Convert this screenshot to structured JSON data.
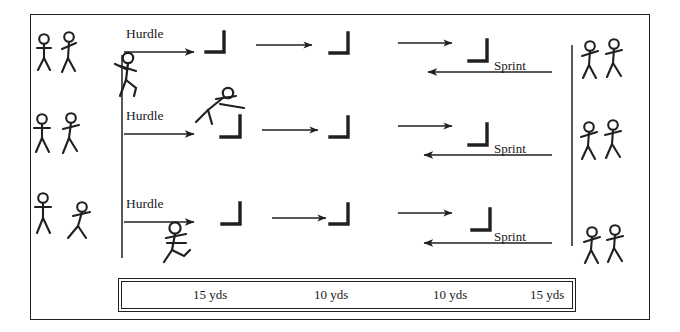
{
  "diagram": {
    "frame": {
      "x": 30,
      "y": 14,
      "width": 620,
      "height": 306
    },
    "colors": {
      "ink": "#231f20",
      "line": "#333333",
      "background": "#ffffff"
    },
    "start_line": {
      "label": "start-line",
      "x": 122,
      "y1": 55,
      "y2": 258
    },
    "finish_line": {
      "label": "finish-line",
      "x": 572,
      "y1": 45,
      "y2": 246
    },
    "lanes": [
      {
        "lane_number": 1,
        "hurdle_label": "Hurdle",
        "sprint_label": "Sprint",
        "runner_pose": "standing-start",
        "hurdle_marks": 3,
        "waiting_left": 2,
        "waiting_right": 2
      },
      {
        "lane_number": 2,
        "hurdle_label": "Hurdle",
        "sprint_label": "Sprint",
        "runner_pose": "jumping-hurdle",
        "hurdle_marks": 3,
        "waiting_left": 2,
        "waiting_right": 2
      },
      {
        "lane_number": 3,
        "hurdle_label": "Hurdle",
        "sprint_label": "Sprint",
        "runner_pose": "running",
        "hurdle_marks": 3,
        "waiting_left": 2,
        "waiting_right": 2
      }
    ],
    "distance_scale": {
      "name": "distance-bar",
      "segments": [
        {
          "label": "15 yds",
          "value": 15,
          "unit": "yds"
        },
        {
          "label": "10 yds",
          "value": 10,
          "unit": "yds"
        },
        {
          "label": "10 yds",
          "value": 10,
          "unit": "yds"
        },
        {
          "label": "15 yds",
          "value": 15,
          "unit": "yds"
        }
      ],
      "total_label": "50 yds"
    }
  }
}
